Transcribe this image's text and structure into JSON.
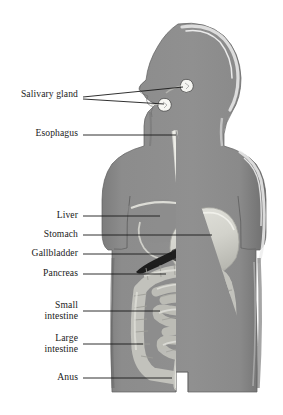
{
  "diagram": {
    "style": "grayscale shaded anatomical drawing",
    "background_color": "#ffffff",
    "colors": {
      "body_fill": "#8f8f8f",
      "body_shadow": "#6f6f6f",
      "body_highlight": "#d9d9d9",
      "organ_pale": "#d6d6d0",
      "organ_mid": "#b8b8b2",
      "organ_dark": "#1d1d1d",
      "gland_white": "#f4f4f0",
      "leader_line": "#1a1a1a",
      "label_text": "#1a1a1a"
    },
    "labels": [
      {
        "id": "salivary-gland",
        "text": "Salivary gland",
        "x": 78,
        "y": 94,
        "leader_lines": [
          {
            "x1": 83,
            "y1": 97,
            "x2": 183,
            "y2": 87
          },
          {
            "x1": 83,
            "y1": 99,
            "x2": 164,
            "y2": 104
          }
        ]
      },
      {
        "id": "esophagus",
        "text": "Esophagus",
        "x": 78,
        "y": 131,
        "leader_lines": [
          {
            "x1": 83,
            "y1": 135,
            "x2": 176,
            "y2": 135
          }
        ]
      },
      {
        "id": "liver",
        "text": "Liver",
        "x": 78,
        "y": 211,
        "leader_lines": [
          {
            "x1": 83,
            "y1": 216,
            "x2": 160,
            "y2": 216
          }
        ]
      },
      {
        "id": "stomach",
        "text": "Stomach",
        "x": 78,
        "y": 230,
        "leader_lines": [
          {
            "x1": 83,
            "y1": 235,
            "x2": 212,
            "y2": 235
          }
        ]
      },
      {
        "id": "gallbladder",
        "text": "Gallbladder",
        "x": 78,
        "y": 249,
        "leader_lines": [
          {
            "x1": 83,
            "y1": 254,
            "x2": 172,
            "y2": 254
          }
        ]
      },
      {
        "id": "pancreas",
        "text": "Pancreas",
        "x": 78,
        "y": 270,
        "leader_lines": [
          {
            "x1": 83,
            "y1": 274,
            "x2": 166,
            "y2": 274
          }
        ]
      },
      {
        "id": "small-intestine",
        "text": "Small\nintestine",
        "x": 78,
        "y": 303,
        "leader_lines": [
          {
            "x1": 83,
            "y1": 311,
            "x2": 160,
            "y2": 311
          }
        ]
      },
      {
        "id": "large-intestine",
        "text": "Large\nintestine",
        "x": 78,
        "y": 340,
        "leader_lines": [
          {
            "x1": 83,
            "y1": 344,
            "x2": 143,
            "y2": 344
          }
        ]
      },
      {
        "id": "anus",
        "text": "Anus",
        "x": 78,
        "y": 374,
        "leader_lines": [
          {
            "x1": 83,
            "y1": 378,
            "x2": 172,
            "y2": 378
          }
        ]
      }
    ],
    "organs": [
      {
        "id": "salivary-gland-parotid",
        "name": "parotid salivary gland"
      },
      {
        "id": "salivary-gland-submandibular",
        "name": "submandibular salivary gland"
      },
      {
        "id": "esophagus",
        "name": "esophagus"
      },
      {
        "id": "liver",
        "name": "liver"
      },
      {
        "id": "stomach",
        "name": "stomach"
      },
      {
        "id": "gallbladder",
        "name": "gallbladder"
      },
      {
        "id": "pancreas",
        "name": "pancreas"
      },
      {
        "id": "small-intestine",
        "name": "small intestine"
      },
      {
        "id": "large-intestine",
        "name": "large intestine"
      },
      {
        "id": "rectum-anus",
        "name": "rectum and anus"
      }
    ]
  }
}
